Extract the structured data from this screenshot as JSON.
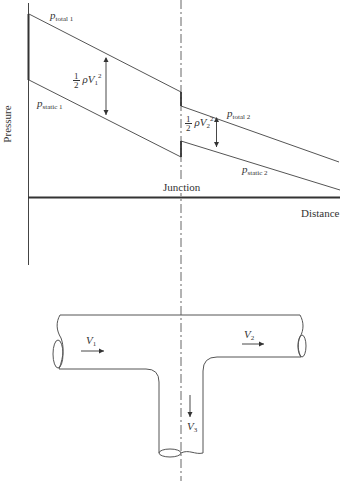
{
  "diagram": {
    "axes": {
      "y_label": "Pressure",
      "x_label": "Distance",
      "junction_label": "Junction"
    },
    "lines": {
      "p_total_1": {
        "symbol": "p",
        "subscript": "total 1"
      },
      "p_static_1": {
        "symbol": "p",
        "subscript": "static 1"
      },
      "p_total_2": {
        "symbol": "p",
        "subscript": "total 2"
      },
      "p_static_2": {
        "symbol": "p",
        "subscript": "static 2"
      }
    },
    "dynamic_pressure": {
      "upstream": {
        "numerator": "1",
        "denominator": "2",
        "rho": "ρ",
        "velocity": "V",
        "v_sub": "1",
        "power": "2"
      },
      "downstream": {
        "numerator": "1",
        "denominator": "2",
        "rho": "ρ",
        "velocity": "V",
        "v_sub": "2",
        "power": "2"
      }
    },
    "pipe": {
      "v1": {
        "symbol": "V",
        "sub": "1"
      },
      "v2": {
        "symbol": "V",
        "sub": "2"
      },
      "v3": {
        "symbol": "V",
        "sub": "3"
      }
    },
    "colors": {
      "line": "#555555",
      "axis": "#333333",
      "background": "#ffffff"
    }
  }
}
